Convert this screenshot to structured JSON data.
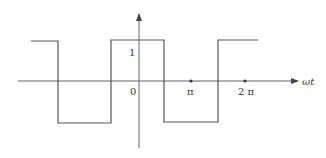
{
  "diagram": {
    "type": "square-wave",
    "axes": {
      "x_label": "ωt",
      "y_tick_label": "1",
      "origin_label": "0",
      "x_ticks": [
        {
          "label": "π"
        },
        {
          "label": "2 π"
        }
      ]
    },
    "waveform": {
      "high_value": 1,
      "low_value": -1,
      "transitions": [
        "-3π/2",
        "-π/2",
        "π/2",
        "3π/2"
      ]
    },
    "colors": {
      "line": "#555555",
      "text": "#333333"
    }
  }
}
